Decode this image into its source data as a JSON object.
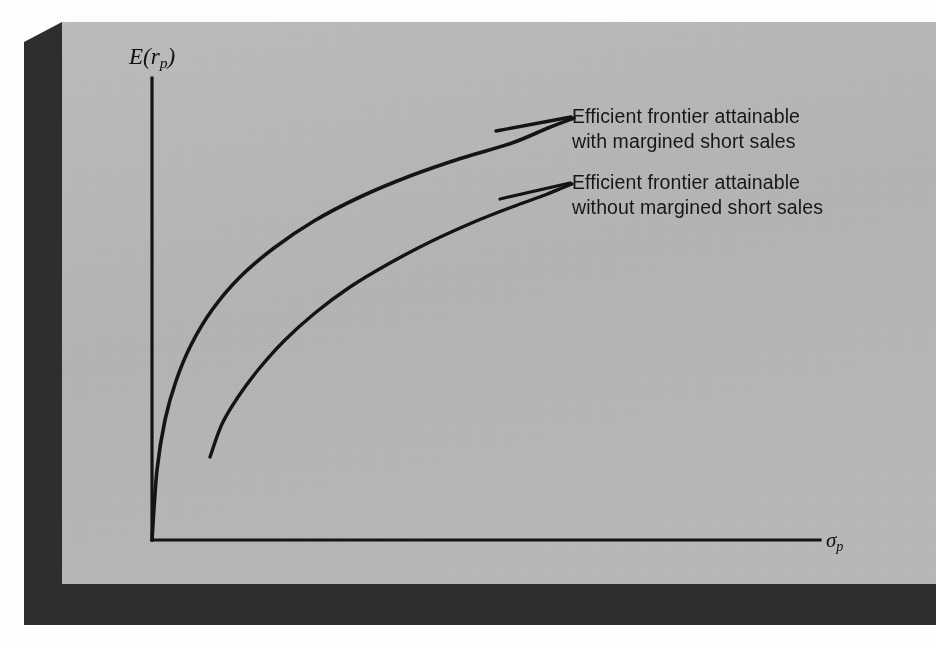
{
  "figure": {
    "kind": "efficient-frontier-diagram",
    "panel_color": "#b6b6b6",
    "shadow_color": "#2e2e2e",
    "page_color": "#ffffff",
    "ink_color": "#141414"
  },
  "axes": {
    "y_label_text": "E(r",
    "y_label_sub": "p",
    "y_label_close": ")",
    "y_label_full": "E(rp)",
    "x_label_sigma": "σ",
    "x_label_sub": "p",
    "x_label_full": "σp"
  },
  "annotations": {
    "upper": {
      "line1": "Efficient frontier attainable",
      "line2": "with margined short sales"
    },
    "lower": {
      "line1": "Efficient frontier attainable",
      "line2": "without margined short sales"
    }
  },
  "chart_data": {
    "type": "line",
    "title": "",
    "xlabel": "σp",
    "ylabel": "E(rp)",
    "grid": false,
    "legend_position": "inline-right",
    "axis_origin_px": [
      152,
      540
    ],
    "x_axis_end_px": [
      820,
      540
    ],
    "y_axis_top_px": [
      152,
      78
    ],
    "series": [
      {
        "name": "Efficient frontier attainable with margined short sales",
        "label_lines": [
          "Efficient frontier attainable",
          "with margined short sales"
        ],
        "stroke": "#141414",
        "stroke_width": 3.6,
        "points_px": [
          [
            152,
            540
          ],
          [
            157,
            470
          ],
          [
            165,
            420
          ],
          [
            176,
            381
          ],
          [
            191,
            345
          ],
          [
            212,
            310
          ],
          [
            240,
            277
          ],
          [
            274,
            248
          ],
          [
            314,
            221
          ],
          [
            360,
            197
          ],
          [
            410,
            176
          ],
          [
            462,
            158
          ],
          [
            512,
            143
          ],
          [
            548,
            128
          ],
          [
            574,
            118
          ]
        ]
      },
      {
        "name": "Efficient frontier attainable without margined short sales",
        "label_lines": [
          "Efficient frontier attainable",
          "without margined short sales"
        ],
        "stroke": "#141414",
        "stroke_width": 3.4,
        "points_px": [
          [
            210,
            457
          ],
          [
            222,
            424
          ],
          [
            238,
            397
          ],
          [
            258,
            370
          ],
          [
            284,
            341
          ],
          [
            315,
            313
          ],
          [
            350,
            287
          ],
          [
            390,
            263
          ],
          [
            432,
            241
          ],
          [
            474,
            222
          ],
          [
            512,
            207
          ],
          [
            545,
            195
          ],
          [
            562,
            188
          ],
          [
            572,
            184
          ]
        ]
      }
    ]
  }
}
